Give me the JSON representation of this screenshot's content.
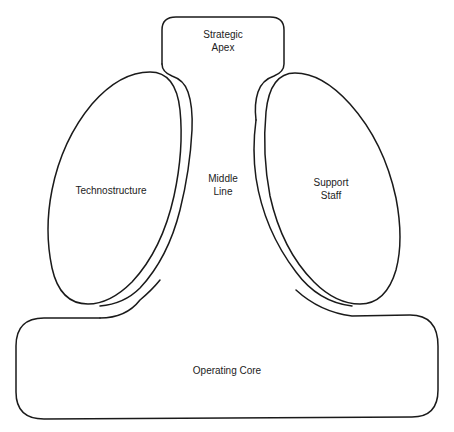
{
  "diagram": {
    "type": "organization-structure",
    "parts": [
      {
        "id": "strategic-apex",
        "label_lines": [
          "Strategic",
          "Apex"
        ]
      },
      {
        "id": "technostructure",
        "label_lines": [
          "Technostructure"
        ]
      },
      {
        "id": "middle-line",
        "label_lines": [
          "Middle",
          "Line"
        ]
      },
      {
        "id": "support-staff",
        "label_lines": [
          "Support",
          "Staff"
        ]
      },
      {
        "id": "operating-core",
        "label_lines": [
          "Operating Core"
        ]
      }
    ],
    "colors": {
      "stroke": "#1a1a1a",
      "text": "#222222",
      "background": "#ffffff"
    }
  }
}
